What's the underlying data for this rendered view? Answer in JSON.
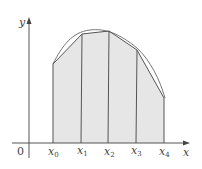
{
  "diagram": {
    "axes": {
      "x_label": "x",
      "y_label": "y",
      "origin_label": "0"
    },
    "nodes": [
      {
        "label": "x",
        "sub": "0"
      },
      {
        "label": "x",
        "sub": "1"
      },
      {
        "label": "x",
        "sub": "2"
      },
      {
        "label": "x",
        "sub": "3"
      },
      {
        "label": "x",
        "sub": "4"
      }
    ],
    "colors": {
      "fill": "#e6e6e6",
      "stroke": "#555555",
      "axis": "#555555"
    }
  }
}
